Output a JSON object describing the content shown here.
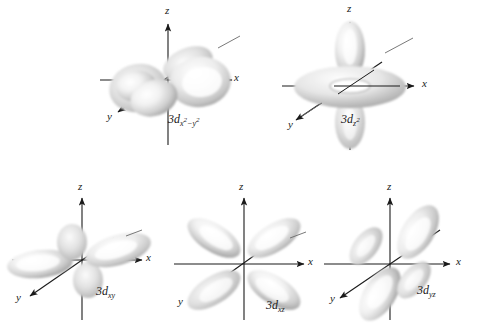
{
  "figure": {
    "background_color": "#ffffff",
    "axis_color": "#1a1a1a",
    "lobe_color": "#c8c8c8",
    "lobe_highlight": "#ffffff",
    "lobe_shadow": "#8f8f8f"
  },
  "axis_labels": {
    "x": "x",
    "y": "y",
    "z": "z"
  },
  "orbitals": [
    {
      "id": "3d-x2-y2",
      "name": "3d x squared minus y squared orbital",
      "label_prefix": "3d",
      "label_sub_main": "x",
      "label_sub_sup1": "2",
      "label_sub_minus": "−",
      "label_sub_second": "y",
      "label_sub_sup2": "2",
      "label_plain": "3dx²−y²",
      "row": 1,
      "column": 1,
      "lobe_count": 4,
      "lobe_orientation": "along x and y axes",
      "has_torus": false
    },
    {
      "id": "3d-z2",
      "name": "3d z squared orbital",
      "label_prefix": "3d",
      "label_sub_main": "z",
      "label_sub_sup1": "2",
      "label_plain": "3dz²",
      "row": 1,
      "column": 2,
      "lobe_count": 2,
      "lobe_orientation": "along z axis with equatorial torus",
      "has_torus": true
    },
    {
      "id": "3d-xy",
      "name": "3d xy orbital",
      "label_prefix": "3d",
      "label_sub_main": "xy",
      "label_plain": "3dxy",
      "row": 2,
      "column": 1,
      "lobe_count": 4,
      "lobe_orientation": "between x and y axes",
      "has_torus": false
    },
    {
      "id": "3d-xz",
      "name": "3d xz orbital",
      "label_prefix": "3d",
      "label_sub_main": "xz",
      "label_plain": "3dxz",
      "row": 2,
      "column": 2,
      "lobe_count": 4,
      "lobe_orientation": "between x and z axes",
      "has_torus": false
    },
    {
      "id": "3d-yz",
      "name": "3d yz orbital",
      "label_prefix": "3d",
      "label_sub_main": "yz",
      "label_plain": "3dyz",
      "row": 2,
      "column": 3,
      "lobe_count": 4,
      "lobe_orientation": "between y and z axes",
      "has_torus": false
    }
  ]
}
